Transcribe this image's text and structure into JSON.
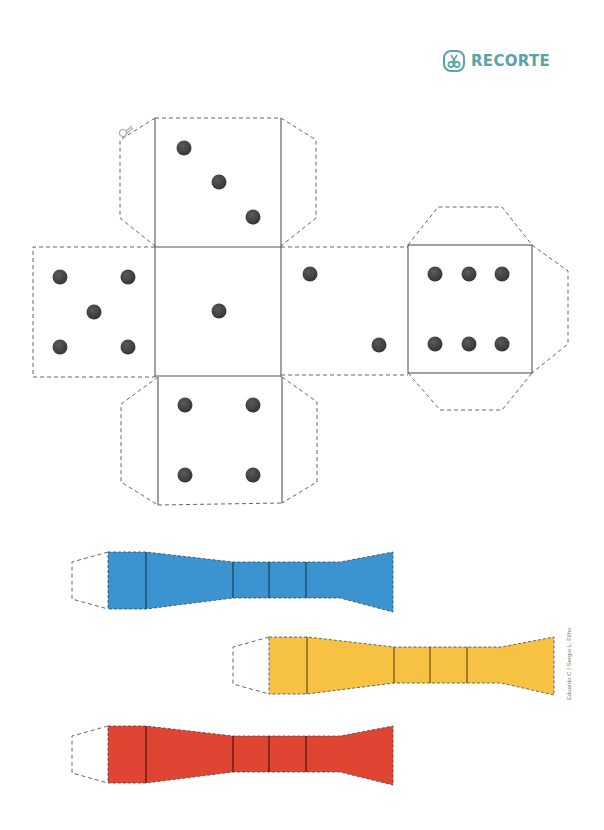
{
  "header": {
    "label": "RECORTE",
    "icon": "scissors-icon",
    "color": "#5aa3a8"
  },
  "die_net": {
    "faces": [
      {
        "name": "top",
        "pips": 3
      },
      {
        "name": "left",
        "pips": 5
      },
      {
        "name": "center",
        "pips": 1
      },
      {
        "name": "right-inner",
        "pips": 2
      },
      {
        "name": "right-outer",
        "pips": 6
      },
      {
        "name": "bottom",
        "pips": 4
      }
    ],
    "pip_color": "#444444",
    "cut_icon": "scissors-icon"
  },
  "strips": [
    {
      "name": "blue",
      "color": "#3b93d0"
    },
    {
      "name": "yellow",
      "color": "#f7c244"
    },
    {
      "name": "red",
      "color": "#e04533"
    }
  ],
  "credit": "Eduardo C / Sergio L. Filho"
}
